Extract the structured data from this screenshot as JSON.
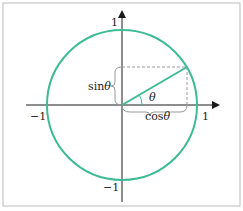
{
  "diagram": {
    "type": "unit-circle",
    "colors": {
      "circle": "#3dbb95",
      "axes": "#1a1a1a",
      "dashed": "#999999",
      "frame": "#bbbbbb"
    },
    "labels": {
      "y_top": "1",
      "y_bottom": "−1",
      "x_left": "−1",
      "x_right": "1",
      "sin": "sin",
      "cos": "cos",
      "theta": "θ"
    }
  }
}
